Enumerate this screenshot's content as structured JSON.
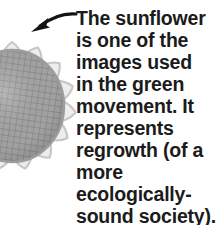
{
  "figure": {
    "caption_text": "The sunflower\nis one of the\nimages used\nin the green\nmovement. It\nrepresents\nregrowth (of a\nmore\necologically-\nsound society).",
    "caption_lines": [
      "The sunflower",
      "is one of the",
      "images used",
      "in the green",
      "movement. It",
      "represents",
      "regrowth (of a",
      "more",
      "ecologically-",
      "sound society)."
    ],
    "subject": "sunflower",
    "illustration_name": "sunflower-illustration",
    "pointer_name": "pointer-arrow",
    "colors": {
      "background": "#ffffff",
      "text": "#1b1b1b",
      "arrow": "#141414",
      "petal_fill": "#ededed",
      "petal_outline": "#c9c9c9",
      "disc_fill": "#a9a9a9",
      "disc_grid": "#8a8a8a",
      "disc_shadow": "#9a9a9a"
    }
  }
}
